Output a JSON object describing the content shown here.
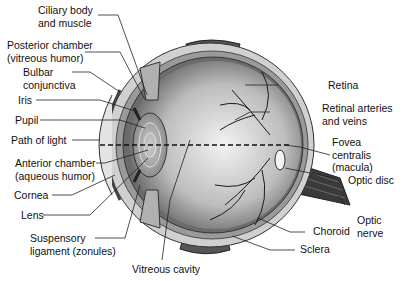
{
  "diagram": {
    "labels": {
      "ciliary": [
        "Ciliary body",
        "and muscle"
      ],
      "posterior": [
        "Posterior chamber",
        "(vitreous humor)"
      ],
      "bulbar": [
        "Bulbar",
        "conjunctiva"
      ],
      "iris": "Iris",
      "pupil": "Pupil",
      "path": "Path of light",
      "anterior": [
        "Anterior chamber",
        "(aqueous humor)"
      ],
      "cornea": "Cornea",
      "lens": "Lens",
      "suspensory": [
        "Suspensory",
        "ligament (zonules)"
      ],
      "vitreous": "Vitreous cavity",
      "retina": "Retina",
      "arteries": [
        "Retinal arteries",
        "and veins"
      ],
      "fovea": [
        "Fovea",
        "centralis",
        "(macula)"
      ],
      "optic_disc": "Optic disc",
      "optic_nerve": [
        "Optic",
        "nerve"
      ],
      "choroid": "Choroid",
      "sclera": "Sclera"
    },
    "colors": {
      "line": "#222222",
      "shade": "#8a8a8a",
      "light": "#d8d8d8"
    }
  }
}
